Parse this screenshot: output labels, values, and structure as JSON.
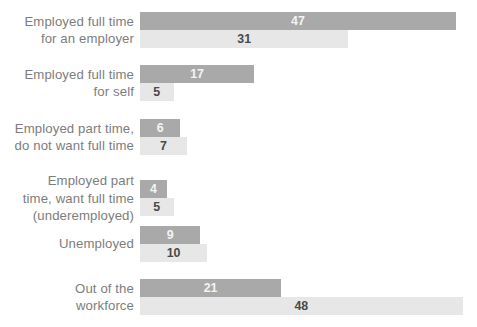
{
  "chart_data": {
    "type": "bar",
    "title": "",
    "subtitle": "",
    "xlabel": "",
    "ylabel": "",
    "orientation": "horizontal",
    "grouping": "grouped",
    "grid": false,
    "legend": "none",
    "units": "percent",
    "xlim": [
      0,
      48
    ],
    "categories": [
      "Employed full time\nfor an employer",
      "Employed full time\nfor self",
      "Employed part time,\ndo not want full time",
      "Employed part\ntime, want full time\n(underemployed)",
      "Unemployed",
      "Out of the\nworkforce"
    ],
    "series": [
      {
        "name": "series-1",
        "color": "#a9a9a9",
        "values": [
          47,
          17,
          6,
          4,
          9,
          21
        ]
      },
      {
        "name": "series-2",
        "color": "#e7e7e7",
        "values": [
          31,
          5,
          7,
          5,
          10,
          48
        ]
      }
    ]
  },
  "rows": [
    {
      "label": "Employed full time\nfor an employer",
      "top": 12,
      "primary": {
        "value": "47",
        "num": 47
      },
      "secondary": {
        "value": "31",
        "num": 31
      }
    },
    {
      "label": "Employed full time\nfor self",
      "top": 65,
      "primary": {
        "value": "17",
        "num": 17
      },
      "secondary": {
        "value": "5",
        "num": 5
      }
    },
    {
      "label": "Employed part time,\ndo not want full time",
      "top": 119,
      "primary": {
        "value": "6",
        "num": 6
      },
      "secondary": {
        "value": "7",
        "num": 7
      }
    },
    {
      "label": "Employed part\ntime, want full time\n(underemployed)",
      "top": 172,
      "primary": {
        "value": "4",
        "num": 4
      },
      "secondary": {
        "value": "5",
        "num": 5
      }
    },
    {
      "label": "Unemployed",
      "top": 226,
      "primary": {
        "value": "9",
        "num": 9
      },
      "secondary": {
        "value": "10",
        "num": 10
      }
    },
    {
      "label": "Out of the\nworkforce",
      "top": 279,
      "primary": {
        "value": "21",
        "num": 21
      },
      "secondary": {
        "value": "48",
        "num": 48
      }
    }
  ],
  "scale": {
    "px_per_unit": 6.72,
    "min_bar_px": 26
  },
  "colors": {
    "primary_bar": "#a9a9a9",
    "secondary_bar": "#e7e7e7",
    "label_text": "#7d7d7d",
    "primary_value_text": "#f4f4f4",
    "secondary_value_text": "#4a4a4a",
    "background": "#ffffff"
  }
}
